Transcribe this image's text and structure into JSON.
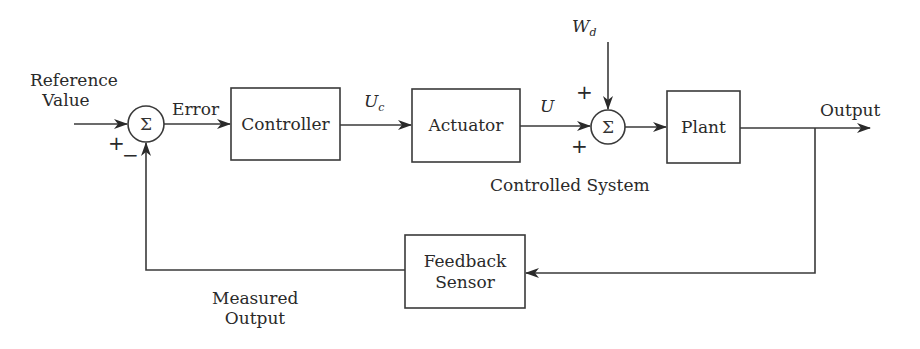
{
  "diagram": {
    "type": "feedback-control-block-diagram",
    "blocks": {
      "controller": "Controller",
      "actuator": "Actuator",
      "plant": "Plant",
      "feedback_sensor_line1": "Feedback",
      "feedback_sensor_line2": "Sensor"
    },
    "summing_junctions": {
      "sum1_symbol": "Σ",
      "sum2_symbol": "Σ"
    },
    "signals": {
      "reference_line1": "Reference",
      "reference_line2": "Value",
      "error": "Error",
      "uc_main": "U",
      "uc_sub": "c",
      "u": "U",
      "wd_main": "W",
      "wd_sub": "d",
      "output": "Output",
      "measured_line1": "Measured",
      "measured_line2": "Output"
    },
    "signs": {
      "sum1_reference": "+",
      "sum1_feedback": "−",
      "sum2_disturbance": "+",
      "sum2_input": "+"
    },
    "group_label": "Controlled System",
    "colors": {
      "stroke": "#3a3a3a",
      "text": "#2a2a2a",
      "background": "#ffffff"
    }
  }
}
